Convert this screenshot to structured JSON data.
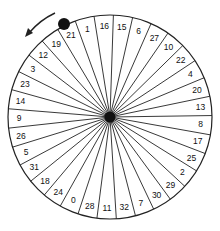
{
  "wheel": {
    "numbers_clockwise_from_top": [
      16,
      15,
      6,
      27,
      10,
      22,
      4,
      20,
      13,
      8,
      17,
      25,
      2,
      29,
      30,
      7,
      32,
      11,
      28,
      0,
      24,
      18,
      31,
      5,
      26,
      9,
      14,
      23,
      3,
      12,
      19,
      21,
      1
    ],
    "sector_count": 33,
    "ball_sector": 21,
    "rotation_direction": "counter-clockwise",
    "colors": {
      "line": "#222222",
      "background": "#ffffff",
      "hub": "#111111",
      "ball": "#111111"
    }
  },
  "icons": {
    "direction_arrow": "curved-arrow-counterclockwise-icon",
    "ball": "ball-icon",
    "hub": "hub-icon"
  }
}
